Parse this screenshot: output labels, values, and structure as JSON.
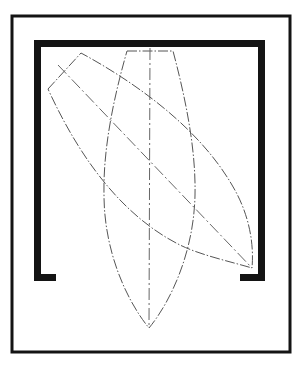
{
  "diagram": {
    "colors": {
      "background": "#ffffff",
      "frame": "#141414",
      "enclosure": "#141414",
      "outline": "#555555",
      "centerline": "#666666"
    },
    "outer_frame": {
      "x": 12,
      "y": 16,
      "width": 278,
      "height": 336
    },
    "enclosure": {
      "left_bar_x": 34,
      "right_bar_x": 258,
      "top_y": 40,
      "foot_y": 274,
      "thickness": 7,
      "left_foot_end_x": 56,
      "right_foot_start_x": 240
    },
    "upright_hull": {
      "top_left": [
        127,
        51
      ],
      "top_right": [
        173,
        51
      ],
      "bottom_tip": [
        149,
        328
      ],
      "max_half_width": 45,
      "centerline_x": 150
    },
    "rotated_hull": {
      "top_left": [
        48,
        89
      ],
      "top_right": [
        81,
        53
      ],
      "bottom_tip": [
        252,
        268
      ],
      "centerline_start": [
        58,
        65
      ]
    }
  }
}
